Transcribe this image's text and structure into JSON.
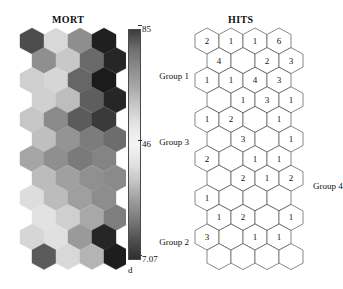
{
  "figure": {
    "type": "som-hexagonal-maps",
    "panels": [
      "MORT",
      "HITS"
    ]
  },
  "mort": {
    "title": "MORT",
    "grid": {
      "rows": 12,
      "cols": 4,
      "layout": "hexagonal-offset"
    },
    "colorbar": {
      "max_label": "85",
      "mid_label": "46",
      "min_label": "7.07",
      "unit_label": "d",
      "colors_top_to_bottom": [
        "#3b3b3b",
        "#6e6e6e",
        "#8c8c8c",
        "#a8a8a8",
        "#c9c9c9",
        "#e6e6e6",
        "#f4f4f4",
        "#e2e2e2",
        "#c2c2c2",
        "#9a9a9a",
        "#777777",
        "#4f4f4f",
        "#2e2e2e"
      ]
    },
    "cells": [
      {
        "row": 0,
        "col": 0,
        "color": "#4d4d4d"
      },
      {
        "row": 0,
        "col": 1,
        "color": "#d8d8d8"
      },
      {
        "row": 0,
        "col": 2,
        "color": "#8e8e8e"
      },
      {
        "row": 0,
        "col": 3,
        "color": "#1f1f1f"
      },
      {
        "row": 1,
        "col": 0,
        "color": "#8f8f8f"
      },
      {
        "row": 1,
        "col": 1,
        "color": "#c8c8c8"
      },
      {
        "row": 1,
        "col": 2,
        "color": "#6a6a6a"
      },
      {
        "row": 1,
        "col": 3,
        "color": "#262626"
      },
      {
        "row": 2,
        "col": 0,
        "color": "#cfcfcf"
      },
      {
        "row": 2,
        "col": 1,
        "color": "#d6d6d6"
      },
      {
        "row": 2,
        "col": 2,
        "color": "#666666"
      },
      {
        "row": 2,
        "col": 3,
        "color": "#1b1b1b"
      },
      {
        "row": 3,
        "col": 0,
        "color": "#d0d0d0"
      },
      {
        "row": 3,
        "col": 1,
        "color": "#bdbdbd"
      },
      {
        "row": 3,
        "col": 2,
        "color": "#5e5e5e"
      },
      {
        "row": 3,
        "col": 3,
        "color": "#262626"
      },
      {
        "row": 4,
        "col": 0,
        "color": "#c6c6c6"
      },
      {
        "row": 4,
        "col": 1,
        "color": "#8a8a8a"
      },
      {
        "row": 4,
        "col": 2,
        "color": "#5b5b5b"
      },
      {
        "row": 4,
        "col": 3,
        "color": "#3a3a3a"
      },
      {
        "row": 5,
        "col": 0,
        "color": "#bfbfbf"
      },
      {
        "row": 5,
        "col": 1,
        "color": "#949494"
      },
      {
        "row": 5,
        "col": 2,
        "color": "#7c7c7c"
      },
      {
        "row": 5,
        "col": 3,
        "color": "#6d6d6d"
      },
      {
        "row": 6,
        "col": 0,
        "color": "#a5a5a5"
      },
      {
        "row": 6,
        "col": 1,
        "color": "#8f8f8f"
      },
      {
        "row": 6,
        "col": 2,
        "color": "#7a7a7a"
      },
      {
        "row": 6,
        "col": 3,
        "color": "#848484"
      },
      {
        "row": 7,
        "col": 0,
        "color": "#bcbcbc"
      },
      {
        "row": 7,
        "col": 1,
        "color": "#a0a0a0"
      },
      {
        "row": 7,
        "col": 2,
        "color": "#909090"
      },
      {
        "row": 7,
        "col": 3,
        "color": "#8a8a8a"
      },
      {
        "row": 8,
        "col": 0,
        "color": "#dddddd"
      },
      {
        "row": 8,
        "col": 1,
        "color": "#bcbcbc"
      },
      {
        "row": 8,
        "col": 2,
        "color": "#9f9f9f"
      },
      {
        "row": 8,
        "col": 3,
        "color": "#8d8d8d"
      },
      {
        "row": 9,
        "col": 0,
        "color": "#e2e2e2"
      },
      {
        "row": 9,
        "col": 1,
        "color": "#cfcfcf"
      },
      {
        "row": 9,
        "col": 2,
        "color": "#a8a8a8"
      },
      {
        "row": 9,
        "col": 3,
        "color": "#7e7e7e"
      },
      {
        "row": 10,
        "col": 0,
        "color": "#d6d6d6"
      },
      {
        "row": 10,
        "col": 1,
        "color": "#e0e0e0"
      },
      {
        "row": 10,
        "col": 2,
        "color": "#9a9a9a"
      },
      {
        "row": 10,
        "col": 3,
        "color": "#262626"
      },
      {
        "row": 11,
        "col": 0,
        "color": "#5a5a5a"
      },
      {
        "row": 11,
        "col": 1,
        "color": "#d8d8d8"
      },
      {
        "row": 11,
        "col": 2,
        "color": "#b4b4b4"
      },
      {
        "row": 11,
        "col": 3,
        "color": "#1d1d1d"
      }
    ]
  },
  "hits": {
    "title": "HITS",
    "grid": {
      "rows": 12,
      "cols": 4,
      "layout": "hexagonal-offset"
    },
    "cells": [
      {
        "row": 0,
        "col": 0,
        "value": "2"
      },
      {
        "row": 0,
        "col": 1,
        "value": "1"
      },
      {
        "row": 0,
        "col": 2,
        "value": "1"
      },
      {
        "row": 0,
        "col": 3,
        "value": "6"
      },
      {
        "row": 1,
        "col": 0,
        "value": "4"
      },
      {
        "row": 1,
        "col": 1,
        "value": ""
      },
      {
        "row": 1,
        "col": 2,
        "value": "2"
      },
      {
        "row": 1,
        "col": 3,
        "value": "3"
      },
      {
        "row": 2,
        "col": 0,
        "value": "1"
      },
      {
        "row": 2,
        "col": 1,
        "value": "1"
      },
      {
        "row": 2,
        "col": 2,
        "value": "4"
      },
      {
        "row": 2,
        "col": 3,
        "value": "3"
      },
      {
        "row": 3,
        "col": 0,
        "value": ""
      },
      {
        "row": 3,
        "col": 1,
        "value": "1"
      },
      {
        "row": 3,
        "col": 2,
        "value": "3"
      },
      {
        "row": 3,
        "col": 3,
        "value": "1"
      },
      {
        "row": 4,
        "col": 0,
        "value": "1"
      },
      {
        "row": 4,
        "col": 1,
        "value": "2"
      },
      {
        "row": 4,
        "col": 2,
        "value": ""
      },
      {
        "row": 4,
        "col": 3,
        "value": "1"
      },
      {
        "row": 5,
        "col": 0,
        "value": ""
      },
      {
        "row": 5,
        "col": 1,
        "value": "3"
      },
      {
        "row": 5,
        "col": 2,
        "value": ""
      },
      {
        "row": 5,
        "col": 3,
        "value": "1"
      },
      {
        "row": 6,
        "col": 0,
        "value": "2"
      },
      {
        "row": 6,
        "col": 1,
        "value": ""
      },
      {
        "row": 6,
        "col": 2,
        "value": "1"
      },
      {
        "row": 6,
        "col": 3,
        "value": "1"
      },
      {
        "row": 7,
        "col": 0,
        "value": ""
      },
      {
        "row": 7,
        "col": 1,
        "value": "2"
      },
      {
        "row": 7,
        "col": 2,
        "value": "1"
      },
      {
        "row": 7,
        "col": 3,
        "value": "2"
      },
      {
        "row": 8,
        "col": 0,
        "value": "1"
      },
      {
        "row": 8,
        "col": 1,
        "value": ""
      },
      {
        "row": 8,
        "col": 2,
        "value": ""
      },
      {
        "row": 8,
        "col": 3,
        "value": ""
      },
      {
        "row": 9,
        "col": 0,
        "value": "1"
      },
      {
        "row": 9,
        "col": 1,
        "value": "2"
      },
      {
        "row": 9,
        "col": 2,
        "value": ""
      },
      {
        "row": 9,
        "col": 3,
        "value": "1"
      },
      {
        "row": 10,
        "col": 0,
        "value": "3"
      },
      {
        "row": 10,
        "col": 1,
        "value": ""
      },
      {
        "row": 10,
        "col": 2,
        "value": "1"
      },
      {
        "row": 10,
        "col": 3,
        "value": "1"
      },
      {
        "row": 11,
        "col": 0,
        "value": ""
      },
      {
        "row": 11,
        "col": 1,
        "value": ""
      },
      {
        "row": 11,
        "col": 2,
        "value": ""
      },
      {
        "row": 11,
        "col": 3,
        "value": ""
      }
    ],
    "annotations": [
      {
        "name": "group-1",
        "label": "Group 1",
        "x": -4,
        "y": 44,
        "anchor": "right"
      },
      {
        "name": "group-3",
        "label": "Group 3",
        "x": -4,
        "y": 110,
        "anchor": "right"
      },
      {
        "name": "group-4",
        "label": "Group 4",
        "x": 120,
        "y": 154,
        "anchor": "left"
      },
      {
        "name": "group-2",
        "label": "Group 2",
        "x": -4,
        "y": 210,
        "anchor": "right"
      }
    ]
  },
  "chart_data": {
    "type": "heatmap",
    "subtitle": "",
    "xlabel": "",
    "ylabel": "",
    "legend_position": "right-of-mort-panel",
    "grid": false,
    "panels": [
      {
        "name": "MORT",
        "type": "heatmap",
        "colormap": "grayscale-reversed",
        "value_range": [
          7.07,
          85
        ],
        "colorbar_ticks": [
          85,
          46,
          7.07
        ],
        "colorbar_unit": "d",
        "rows": 12,
        "cols": 4,
        "values": [
          [
            70,
            30,
            52,
            84
          ],
          [
            52,
            34,
            61,
            80
          ],
          [
            31,
            29,
            62,
            85
          ],
          [
            31,
            36,
            64,
            80
          ],
          [
            33,
            53,
            65,
            74
          ],
          [
            35,
            50,
            56,
            58
          ],
          [
            44,
            52,
            57,
            55
          ],
          [
            36,
            47,
            51,
            53
          ],
          [
            26,
            36,
            47,
            52
          ],
          [
            24,
            31,
            43,
            55
          ],
          [
            29,
            25,
            49,
            80
          ],
          [
            66,
            30,
            39,
            84
          ]
        ]
      },
      {
        "name": "HITS",
        "type": "heatmap",
        "rows": 12,
        "cols": 4,
        "values": [
          [
            2,
            1,
            1,
            6
          ],
          [
            4,
            0,
            2,
            3
          ],
          [
            1,
            1,
            4,
            3
          ],
          [
            0,
            1,
            3,
            1
          ],
          [
            1,
            2,
            0,
            1
          ],
          [
            0,
            3,
            0,
            1
          ],
          [
            2,
            0,
            1,
            1
          ],
          [
            0,
            2,
            1,
            2
          ],
          [
            1,
            0,
            0,
            0
          ],
          [
            1,
            2,
            0,
            1
          ],
          [
            3,
            0,
            1,
            1
          ],
          [
            0,
            0,
            0,
            0
          ]
        ],
        "annotations": [
          "Group 1",
          "Group 3",
          "Group 4",
          "Group 2"
        ]
      }
    ]
  }
}
